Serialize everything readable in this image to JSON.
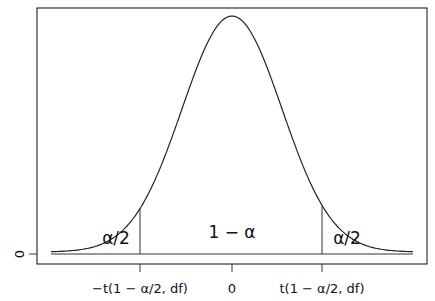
{
  "chart_data": {
    "type": "line",
    "title": "",
    "xlabel": "",
    "ylabel": "",
    "x_ticks": [
      "-t(1-α/2, df)",
      "0",
      "t(1-α/2, df)"
    ],
    "y_ticks": [
      "0"
    ],
    "annotations": {
      "left_tail": "α/2",
      "center": "1 − α",
      "right_tail": "α/2"
    },
    "critical_values": {
      "lower": "-t(1-α/2, df)",
      "upper": "t(1-α/2, df)"
    },
    "grid": false,
    "legend": null
  },
  "labels": {
    "xtick_left": "−t(1 − α/2, df)",
    "xtick_mid": "0",
    "xtick_right": "t(1 − α/2, df)",
    "ytick_zero": "0",
    "left_tail": "α/2",
    "center": "1 − α",
    "right_tail": "α/2"
  }
}
